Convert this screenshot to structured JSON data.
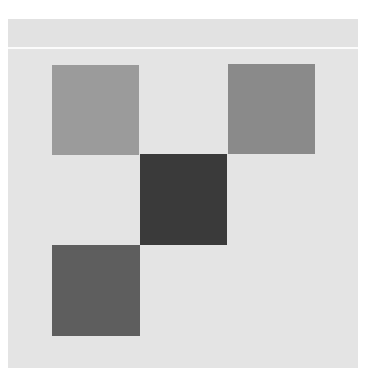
{
  "board": {
    "background_color": "#e4e4e4",
    "header_color": "#e2e2e2",
    "divider_color": "#fbfbfb",
    "tiles": [
      {
        "id": "tile-top-left",
        "row": 0,
        "col": 0,
        "color": "#9b9b9b",
        "x": 44,
        "y": 46,
        "w": 87,
        "h": 90
      },
      {
        "id": "tile-top-right",
        "row": 0,
        "col": 2,
        "color": "#8a8a8a",
        "x": 220,
        "y": 45,
        "w": 87,
        "h": 90
      },
      {
        "id": "tile-center",
        "row": 1,
        "col": 1,
        "color": "#3a3a3a",
        "x": 132,
        "y": 135,
        "w": 87,
        "h": 91
      },
      {
        "id": "tile-bottom-left",
        "row": 2,
        "col": 0,
        "color": "#5e5e5e",
        "x": 44,
        "y": 226,
        "w": 88,
        "h": 91
      }
    ]
  }
}
